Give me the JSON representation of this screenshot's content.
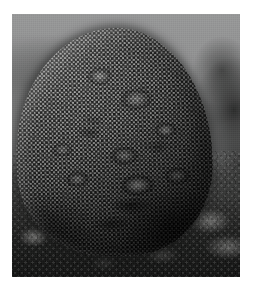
{
  "page": {
    "width": 256,
    "height": 286,
    "background_color": "#ffffff",
    "caption": ""
  },
  "photo": {
    "name": "coral-colony-photograph",
    "alt": "Underwater photograph of a large dome-shaped star coral colony resting on reef rubble, with gray open water behind it",
    "orientation": "portrait",
    "frame": {
      "left": 12,
      "top": 14,
      "width": 228,
      "height": 263
    },
    "palette": {
      "water_light": "#96989a",
      "water_mid": "#84868 8",
      "water_dark": "#4e504e",
      "coral_highlight": "#a9aaa4",
      "coral_mid": "#8d8e88",
      "coral_shadow": "#3b3d39",
      "corallite_pit": "#0c0d0c",
      "substrate_dark": "#16181 5",
      "rubble_light": "#d7d6cd",
      "matte_border": "#ffffff"
    }
  },
  "scene": {
    "subject": "massive star coral colony (boulder coral)",
    "setting": "coral reef, underwater, ambient daylight from above",
    "elements": [
      {
        "name": "open-water-background",
        "label": "Open water",
        "region": "upper",
        "tone": "medium gray, fading darker toward the seafloor"
      },
      {
        "name": "distant-reef-slope",
        "label": "Distant reef slope",
        "region": "upper-left",
        "tone": "soft gray haze"
      },
      {
        "name": "reef-outcrop-right",
        "label": "Dark reef outcrop",
        "region": "right edge",
        "tone": "very dark gray"
      },
      {
        "name": "coral-colony",
        "label": "Coral colony",
        "region": "center",
        "tone": "mid gray with dense dark corallite pits"
      },
      {
        "name": "coral-lobes",
        "label": "Surface lobes and nodules",
        "region": "center and lower-center",
        "tone": "raised lighter bumps with shadowed edges"
      },
      {
        "name": "seafloor-substrate",
        "label": "Reef rubble seafloor",
        "region": "lower",
        "tone": "dark mottled rubble"
      },
      {
        "name": "sand-patch-left",
        "label": "Light rubble patch",
        "region": "lower-left",
        "tone": "pale sandy gray"
      },
      {
        "name": "rubble-patch-right",
        "label": "Light rock patch",
        "region": "lower-right",
        "tone": "pale gray rock"
      }
    ]
  }
}
